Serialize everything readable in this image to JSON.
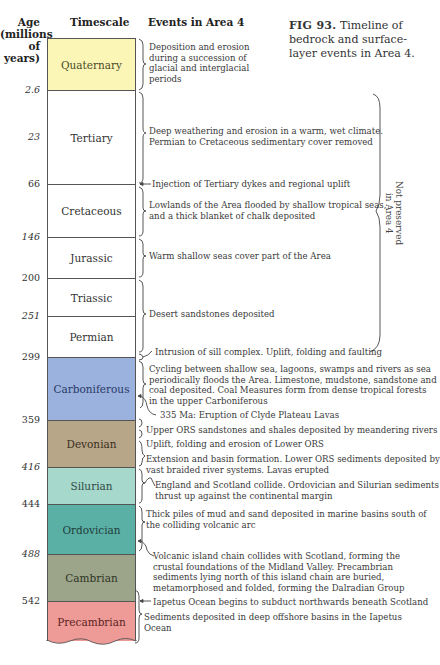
{
  "headers": {
    "age": "Age",
    "age_sub1": "(millions",
    "age_sub2": "of years)",
    "timescale": "Timescale",
    "events": "Events in Area 4"
  },
  "caption": {
    "figure_number": "FIG 93.",
    "text": "Timeline of bedrock and surface-layer events in Area 4."
  },
  "ages": [
    "2.6",
    "23",
    "66",
    "146",
    "200",
    "251",
    "299",
    "359",
    "416",
    "444",
    "488",
    "542"
  ],
  "periods": [
    {
      "name": "Quaternary",
      "color": "#fbf6b6",
      "text_color": "#4a4a2a"
    },
    {
      "name": "Tertiary",
      "color": "#ffffff",
      "text_color": "#333333"
    },
    {
      "name": "Cretaceous",
      "color": "#ffffff",
      "text_color": "#333333"
    },
    {
      "name": "Jurassic",
      "color": "#ffffff",
      "text_color": "#333333"
    },
    {
      "name": "Triassic",
      "color": "#ffffff",
      "text_color": "#333333"
    },
    {
      "name": "Permian",
      "color": "#ffffff",
      "text_color": "#333333"
    },
    {
      "name": "Carboniferous",
      "color": "#9bb2de",
      "text_color": "#2a3a66"
    },
    {
      "name": "Devonian",
      "color": "#b8a688",
      "text_color": "#3a2e1e"
    },
    {
      "name": "Silurian",
      "color": "#a6d8cc",
      "text_color": "#2e4a44"
    },
    {
      "name": "Ordovician",
      "color": "#5bb0a6",
      "text_color": "#1e3e3a"
    },
    {
      "name": "Cambrian",
      "color": "#9ca48a",
      "text_color": "#2e3424"
    },
    {
      "name": "Precambrian",
      "color": "#ee9a96",
      "text_color": "#5a2424"
    }
  ],
  "events": [
    {
      "lines": [
        "Deposition and erosion",
        "during a succession of",
        "glacial and interglacial",
        "periods"
      ]
    },
    {
      "lines": [
        "Deep weathering and erosion in a warm, wet climate.",
        "Permian to Cretaceous sedimentary cover removed"
      ]
    },
    {
      "lines": [
        "Injection of Tertiary dykes and regional uplift"
      ]
    },
    {
      "lines": [
        "Lowlands of the Area flooded by shallow tropical seas,",
        "and a thick blanket of chalk deposited"
      ]
    },
    {
      "lines": [
        "Warm shallow seas cover part of the Area"
      ]
    },
    {
      "lines": [
        "Desert sandstones deposited"
      ]
    },
    {
      "lines": [
        "Intrusion of sill complex. Uplift, folding and faulting"
      ]
    },
    {
      "lines": [
        "Cycling between shallow sea, lagoons, swamps and rivers as sea",
        "periodically floods the Area. Limestone, mudstone, sandstone and",
        "coal deposited. Coal Measures form from dense tropical forests",
        "in the upper Carboniferous"
      ]
    },
    {
      "lines": [
        "335 Ma: Eruption of Clyde Plateau Lavas"
      ]
    },
    {
      "lines": [
        "Upper ORS sandstones and shales deposited by meandering rivers"
      ]
    },
    {
      "lines": [
        "Uplift, folding and erosion of Lower ORS"
      ]
    },
    {
      "lines": [
        "Extension and basin formation. Lower ORS sediments deposited by",
        "vast braided river systems. Lavas erupted"
      ]
    },
    {
      "lines": [
        "England and Scotland collide. Ordovician and Silurian sediments",
        "thrust up against the continental margin"
      ]
    },
    {
      "lines": [
        "Thick piles of mud and sand deposited in marine basins south of",
        "the colliding volcanic arc"
      ]
    },
    {
      "lines": [
        "Volcanic island chain collides with Scotland, forming the",
        "crustal foundations of the Midland Valley. Precambrian",
        "sediments lying north of this island chain are buried,",
        "metamorphosed and folded, forming the Dalradian Group"
      ]
    },
    {
      "lines": [
        "Iapetus Ocean begins to subduct northwards beneath Scotland"
      ]
    },
    {
      "lines": [
        "Sediments deposited in deep offshore basins in the Iapetus",
        "Ocean"
      ]
    }
  ],
  "side_note": {
    "line1": "Not preserved",
    "line2": "in Area 4"
  }
}
